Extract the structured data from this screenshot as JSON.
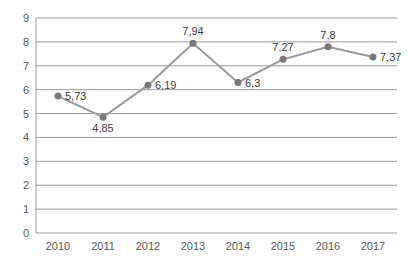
{
  "chart_data": {
    "type": "line",
    "title": "",
    "xlabel": "",
    "ylabel": "",
    "categories": [
      "2010",
      "2011",
      "2012",
      "2013",
      "2014",
      "2015",
      "2016",
      "2017"
    ],
    "values": [
      5.73,
      4.85,
      6.19,
      7.94,
      6.3,
      7.27,
      7.8,
      7.37
    ],
    "value_labels": [
      "5,73",
      "4,85",
      "6,19",
      "7,94",
      "6,3",
      "7,27",
      "7,8",
      "7,37"
    ],
    "label_placements": [
      "right",
      "below",
      "right",
      "above",
      "right",
      "above",
      "above",
      "right"
    ],
    "ylim": [
      0,
      9
    ],
    "ytick_step": 1,
    "ytick_labels": [
      "0",
      "1",
      "2",
      "3",
      "4",
      "5",
      "6",
      "7",
      "8",
      "9"
    ],
    "grid": true,
    "legend": false,
    "marker": "circle"
  },
  "style": {
    "background": "#ffffff",
    "line_color": "#9a9a9a",
    "marker_color": "#787878",
    "grid_color": "#9b9b9b",
    "axis_color": "#9b9b9b",
    "tick_text_color": "#595959",
    "data_label_color": "#3d3d3d"
  }
}
